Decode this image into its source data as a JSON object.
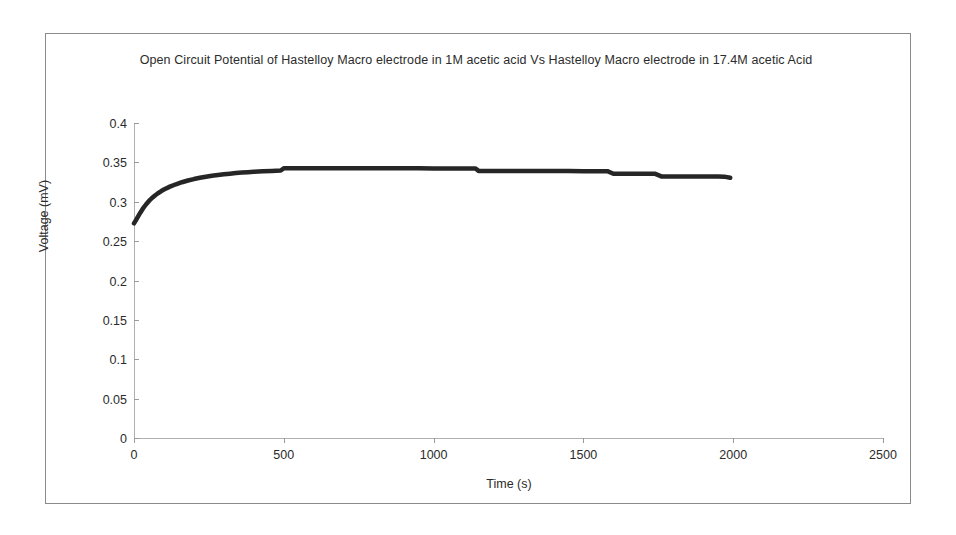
{
  "chart_data": {
    "type": "line",
    "title": "Open Circuit Potential of Hastelloy Macro electrode in 1M acetic acid Vs Hastelloy Macro electrode in 17.4M acetic Acid",
    "xlabel": "Time (s)",
    "ylabel": "Voltage (mV)",
    "xlim": [
      0,
      2500
    ],
    "ylim": [
      0,
      0.4
    ],
    "grid": false,
    "legend": null,
    "xticks": [
      "0",
      "500",
      "1000",
      "1500",
      "2000",
      "2500"
    ],
    "xtick_values": [
      0,
      500,
      1000,
      1500,
      2000,
      2500
    ],
    "yticks": [
      "0",
      "0.05",
      "0.1",
      "0.15",
      "0.2",
      "0.25",
      "0.3",
      "0.35",
      "0.4"
    ],
    "ytick_values": [
      0,
      0.05,
      0.1,
      0.15,
      0.2,
      0.25,
      0.3,
      0.35,
      0.4
    ],
    "series": [
      {
        "name": "Open Circuit Potential",
        "color": "#262626",
        "x": [
          0,
          10,
          20,
          30,
          40,
          50,
          60,
          70,
          80,
          90,
          100,
          120,
          140,
          160,
          180,
          200,
          220,
          240,
          260,
          280,
          300,
          320,
          340,
          360,
          380,
          400,
          430,
          460,
          490,
          500,
          520,
          560,
          600,
          650,
          700,
          750,
          800,
          850,
          900,
          950,
          1000,
          1050,
          1100,
          1140,
          1150,
          1200,
          1250,
          1300,
          1350,
          1400,
          1450,
          1500,
          1550,
          1580,
          1600,
          1650,
          1700,
          1740,
          1760,
          1800,
          1850,
          1900,
          1950,
          1970,
          1990
        ],
        "y": [
          0.2725,
          0.279,
          0.2855,
          0.2915,
          0.2965,
          0.301,
          0.3048,
          0.308,
          0.3108,
          0.3133,
          0.3155,
          0.3192,
          0.3222,
          0.3248,
          0.327,
          0.3288,
          0.3304,
          0.3318,
          0.333,
          0.334,
          0.3349,
          0.3357,
          0.3364,
          0.337,
          0.3376,
          0.3381,
          0.3387,
          0.3392,
          0.3396,
          0.3425,
          0.3426,
          0.3426,
          0.3426,
          0.3426,
          0.3425,
          0.3425,
          0.3425,
          0.3424,
          0.3424,
          0.3424,
          0.3423,
          0.3423,
          0.3422,
          0.3422,
          0.3392,
          0.3391,
          0.3391,
          0.339,
          0.339,
          0.3389,
          0.3389,
          0.3388,
          0.3388,
          0.3388,
          0.3356,
          0.3355,
          0.3355,
          0.3354,
          0.3322,
          0.3321,
          0.3321,
          0.332,
          0.332,
          0.3319,
          0.3305
        ]
      }
    ]
  }
}
